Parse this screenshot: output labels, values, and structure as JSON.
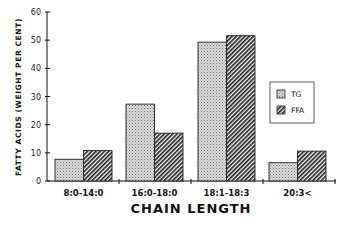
{
  "chart_data": {
    "type": "bar",
    "title": "",
    "xlabel": "CHAIN LENGTH",
    "ylabel": "FATTY ACIDS (WEIGHT PER CENT)",
    "categories": [
      "8:0-14:0",
      "16:0-18:0",
      "18:1-18:3",
      "20:3<"
    ],
    "series": [
      {
        "name": "TG",
        "values": [
          7.7,
          27.3,
          49.3,
          6.5
        ],
        "pattern": "stipple",
        "color": "#c8c8c8"
      },
      {
        "name": "FFA",
        "values": [
          10.8,
          17.0,
          51.6,
          10.6
        ],
        "pattern": "diagonal-hatch",
        "color": "#333333"
      }
    ],
    "ylim": [
      0,
      60
    ],
    "yticks": [
      "0",
      "10",
      "20",
      "30",
      "40",
      "50",
      "60"
    ],
    "grid": false,
    "legend_position": "right-middle"
  },
  "legend": {
    "items": [
      "TG",
      "FFA"
    ]
  }
}
